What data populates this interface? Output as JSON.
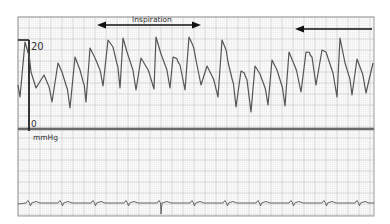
{
  "chart_data": {
    "type": "line",
    "title": "",
    "annotations": [
      {
        "text": "Inspiration",
        "arrow": "double-headed",
        "x_start_px": 97,
        "x_end_px": 200
      },
      {
        "text": "",
        "arrow": "left-pointing",
        "x_start_px": 296,
        "x_end_px": 372
      }
    ],
    "y_axis": {
      "label": "mmHg",
      "ticks": [
        "0",
        "20"
      ],
      "ylim": [
        0,
        20
      ]
    },
    "x_axis": {
      "label": "",
      "ticks": []
    },
    "grid": true,
    "legend": null,
    "series": [
      {
        "name": "pressure",
        "units": "mmHg",
        "points_px": [
          [
            18,
            85
          ],
          [
            20,
            97
          ],
          [
            25,
            42
          ],
          [
            31,
            72
          ],
          [
            36,
            88
          ],
          [
            44,
            75
          ],
          [
            52,
            102
          ],
          [
            58,
            63
          ],
          [
            62,
            72
          ],
          [
            70,
            108
          ],
          [
            75,
            57
          ],
          [
            80,
            70
          ],
          [
            86,
            102
          ],
          [
            90,
            48
          ],
          [
            95,
            58
          ],
          [
            103,
            86
          ],
          [
            108,
            40
          ],
          [
            113,
            47
          ],
          [
            120,
            88
          ],
          [
            123,
            38
          ],
          [
            127,
            52
          ],
          [
            136,
            90
          ],
          [
            141,
            58
          ],
          [
            154,
            89
          ],
          [
            156,
            37
          ],
          [
            161,
            54
          ],
          [
            170,
            88
          ],
          [
            173,
            57
          ],
          [
            180,
            65
          ],
          [
            185,
            90
          ],
          [
            189,
            37
          ],
          [
            196,
            60
          ],
          [
            201,
            85
          ],
          [
            207,
            66
          ],
          [
            218,
            97
          ],
          [
            222,
            40
          ],
          [
            228,
            62
          ],
          [
            236,
            107
          ],
          [
            241,
            71
          ],
          [
            247,
            80
          ],
          [
            251,
            112
          ],
          [
            255,
            66
          ],
          [
            260,
            74
          ],
          [
            268,
            105
          ],
          [
            272,
            60
          ],
          [
            277,
            70
          ],
          [
            285,
            106
          ],
          [
            289,
            52
          ],
          [
            301,
            92
          ],
          [
            306,
            52
          ],
          [
            312,
            57
          ],
          [
            316,
            85
          ],
          [
            322,
            50
          ],
          [
            326,
            52
          ],
          [
            337,
            97
          ],
          [
            340,
            38
          ],
          [
            345,
            63
          ],
          [
            352,
            95
          ],
          [
            357,
            59
          ],
          [
            366,
            93
          ],
          [
            373,
            63
          ]
        ]
      },
      {
        "name": "ECG",
        "units": "",
        "beat_x_px": [
          30,
          62,
          95,
          128,
          161,
          194,
          227,
          260,
          293,
          326,
          359
        ],
        "large_spike_x_px": 161
      }
    ]
  },
  "labels": {
    "y_top": "20",
    "y_zero": "0",
    "units": "mmHg",
    "inspiration": "Inspiration"
  },
  "colors": {
    "trace": "#555555",
    "grid_minor": "#e3e3e3",
    "grid_major": "#c9c9c9",
    "frame": "#9a9a9a",
    "baseline": "#6a6a6a",
    "arrow": "#111111"
  }
}
